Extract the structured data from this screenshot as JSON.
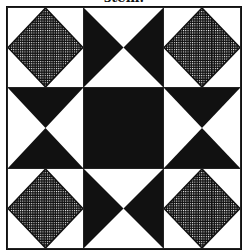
{
  "caption": "stem.",
  "colors": {
    "ink": "#111111",
    "paper": "#ffffff"
  },
  "quilt": {
    "name": "nine-patch quilt block",
    "rows": 3,
    "cols": 3,
    "cells": [
      [
        "checkered-diamond",
        "hourglass-vertical-white",
        "checkered-diamond"
      ],
      [
        "hourglass-horizontal-white",
        "solid-black",
        "hourglass-horizontal-white"
      ],
      [
        "checkered-diamond",
        "hourglass-vertical-white",
        "checkered-diamond"
      ]
    ]
  }
}
